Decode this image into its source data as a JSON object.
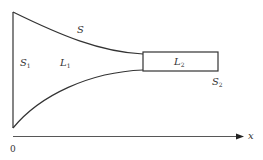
{
  "diagram": {
    "type": "tube-geometry",
    "labels": {
      "surface": "S",
      "inlet_section": {
        "base": "S",
        "sub": "1"
      },
      "region_one": {
        "base": "L",
        "sub": "1"
      },
      "region_two": {
        "base": "L",
        "sub": "2"
      },
      "outlet_section": {
        "base": "S",
        "sub": "2"
      }
    },
    "axis": {
      "label": "x",
      "origin_label": "0"
    },
    "colors": {
      "stroke": "#333333",
      "axis": "#444444",
      "background": "#ffffff"
    }
  }
}
